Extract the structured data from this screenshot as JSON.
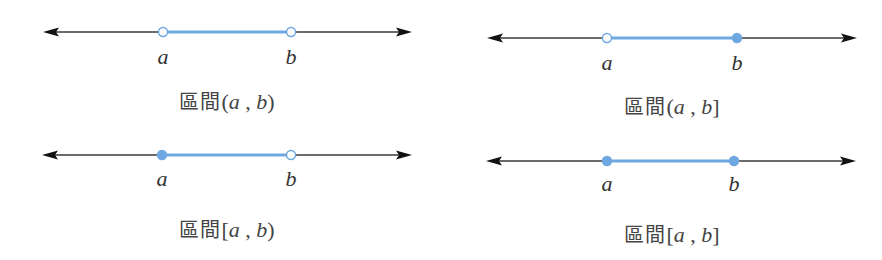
{
  "colors": {
    "axis": "#3a3a3a",
    "segment": "#6fa8e0",
    "endpoint_fill": "#6fa8e0",
    "endpoint_open_fill": "#ffffff",
    "text": "#333333"
  },
  "panels": [
    {
      "id": "open",
      "caption": {
        "word": "區間",
        "left": "(",
        "a": "a",
        "sep": " , ",
        "b": "b",
        "right": ")"
      },
      "label_a": "a",
      "label_b": "b",
      "a_closed": false,
      "b_closed": false,
      "geom": {
        "x1": 43,
        "x2": 412,
        "y": 32,
        "ax": 163,
        "bx": 291,
        "label_y": 64,
        "cap_x": 227,
        "cap_y": 86
      }
    },
    {
      "id": "left-open-right-closed",
      "caption": {
        "word": "區間",
        "left": "(",
        "a": "a",
        "sep": " , ",
        "b": "b",
        "right": "]"
      },
      "label_a": "a",
      "label_b": "b",
      "a_closed": false,
      "b_closed": true,
      "geom": {
        "x1": 487,
        "x2": 857,
        "y": 38,
        "ax": 607,
        "bx": 737,
        "label_y": 70,
        "cap_x": 672,
        "cap_y": 91
      }
    },
    {
      "id": "left-closed-right-open",
      "caption": {
        "word": "區間",
        "left": "[",
        "a": "a",
        "sep": " , ",
        "b": "b",
        "right": ")"
      },
      "label_a": "a",
      "label_b": "b",
      "a_closed": true,
      "b_closed": false,
      "geom": {
        "x1": 42,
        "x2": 412,
        "y": 155,
        "ax": 162,
        "bx": 291,
        "label_y": 186,
        "cap_x": 227,
        "cap_y": 214
      }
    },
    {
      "id": "closed",
      "caption": {
        "word": "區間",
        "left": "[",
        "a": "a",
        "sep": " , ",
        "b": "b",
        "right": "]"
      },
      "label_a": "a",
      "label_b": "b",
      "a_closed": true,
      "b_closed": true,
      "geom": {
        "x1": 486,
        "x2": 856,
        "y": 161,
        "ax": 607,
        "bx": 734,
        "label_y": 191,
        "cap_x": 672,
        "cap_y": 219
      }
    }
  ]
}
